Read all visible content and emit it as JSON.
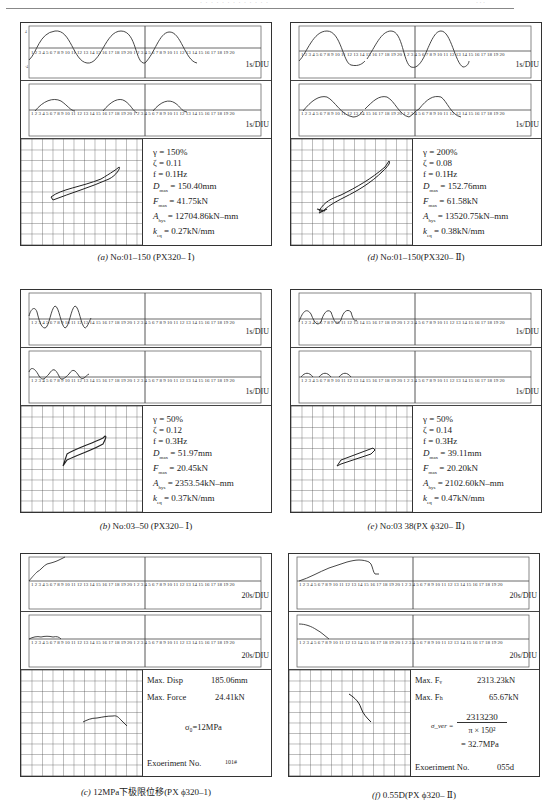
{
  "header": {
    "running_title": "· · · · · · · · · · · · ·",
    "page_number": "· · ·"
  },
  "panels": {
    "a": {
      "caption_prefix": "(a)",
      "caption_text": " No:01–150 (PX320– Ⅰ)",
      "trace_unit": "1s/DIU",
      "params": {
        "gamma": "γ = 150%",
        "zeta": "ζ = 0.11",
        "f": "f = 0.1Hz",
        "dmax": "= 150.40mm",
        "fmax": "= 41.75kN",
        "ahys": "= 12704.86kN–mm",
        "keq": "= 0.27kN/mm"
      }
    },
    "d": {
      "caption_prefix": "(d)",
      "caption_text": " No:01–150(PX320– Ⅱ)",
      "trace_unit": "1s/DIU",
      "params": {
        "gamma": "γ = 200%",
        "zeta": "ζ = 0.08",
        "f": "f = 0.1Hz",
        "dmax": "= 152.76mm",
        "fmax": "= 61.58kN",
        "ahys": "= 13520.75kN–mm",
        "keq": "= 0.38kN/mm"
      }
    },
    "b": {
      "caption_prefix": "(b)",
      "caption_text": " No:03–50 (PX320– Ⅰ)",
      "trace_unit": "1s/DIU",
      "params": {
        "gamma": "γ = 50%",
        "zeta": "ζ = 0.12",
        "f": "f = 0.3Hz",
        "dmax": "= 51.97mm",
        "fmax": "= 20.45kN",
        "ahys": "= 2353.54kN–mm",
        "keq": "= 0.37kN/mm"
      }
    },
    "e": {
      "caption_prefix": "(e)",
      "caption_text": " No:03  38(PX ϕ320– Ⅱ)",
      "trace_unit": "1s/DIU",
      "params": {
        "gamma": "γ = 50%",
        "zeta": "ζ = 0.14",
        "f": "f = 0.3Hz",
        "dmax": "= 39.11mm",
        "fmax": "= 20.20kN",
        "ahys": "= 2102.60kN–mm",
        "keq": "= 0.47kN/mm"
      }
    },
    "c": {
      "caption_prefix": "(c)",
      "caption_text": " 12MPa下极限位移(PX ϕ320–1)",
      "trace_unit": "20s/DIU",
      "max_disp_label": "Max. Disp",
      "max_disp_value": "185.06mm",
      "max_force_label": "Max. Force",
      "max_force_value": "24.41kN",
      "sigma": "σ₀=12MPa",
      "exp_label": "Exoeriment No.",
      "exp_value": "101#"
    },
    "f": {
      "caption_prefix": "(f)",
      "caption_text": " 0.55D(PX ϕ320– Ⅱ)",
      "trace_unit": "20s/DIU",
      "max_fv_label": "Max. Fᵥ",
      "max_fv_value": "2313.23kN",
      "max_fh_label": "Max. Fₕ",
      "max_fh_value": "65.67kN",
      "sigma_label": "σ_ver =",
      "numerator": "2313230",
      "denominator": "π × 150²",
      "result": "= 32.7MPa",
      "exp_label": "Exoeriment No.",
      "exp_value": "055d"
    }
  },
  "labels": {
    "dmax": "D",
    "dmax_sub": "max",
    "fmax": "F",
    "fmax_sub": "max",
    "ahys": "A",
    "ahys_sub": "hys",
    "keq": "k",
    "keq_sub": "eq"
  },
  "axis_ticks": "1 2 3 4 5 6 7 8 9 10 11 12 13 14 15 16 17 18 19 20"
}
